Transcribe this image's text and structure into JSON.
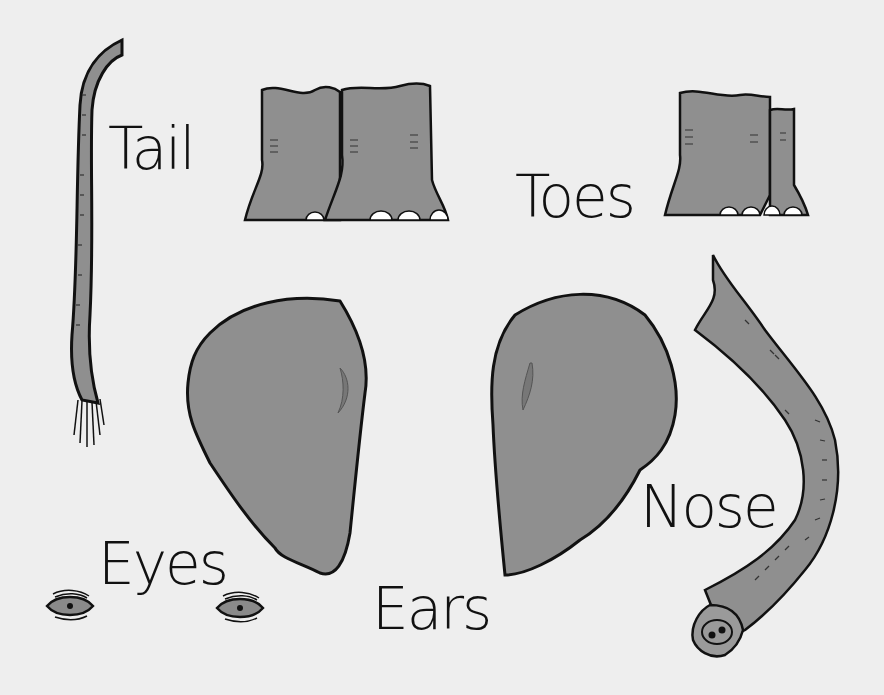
{
  "illustration": {
    "subject": "Elephant body parts",
    "colors": {
      "background": "#eeeeee",
      "skin": "#8f8f8f",
      "skin_light": "#9a9a9a",
      "outline": "#111111",
      "toenail": "#ffffff",
      "ear_inner": "#777777"
    }
  },
  "labels": {
    "tail": "Tail",
    "toes": "Toes",
    "ears": "Ears",
    "eyes": "Eyes",
    "nose": "Nose"
  }
}
